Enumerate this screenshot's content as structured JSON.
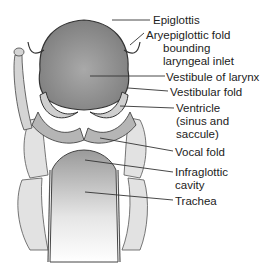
{
  "diagram": {
    "labels": [
      {
        "id": "epiglottis",
        "lines": [
          "Epiglottis"
        ]
      },
      {
        "id": "aryepiglottic",
        "lines": [
          "Aryepiglottic fold",
          "bounding",
          "laryngeal inlet"
        ]
      },
      {
        "id": "vestibule",
        "lines": [
          "Vestibule of larynx"
        ]
      },
      {
        "id": "vestibular-fold",
        "lines": [
          "Vestibular fold"
        ]
      },
      {
        "id": "ventricle",
        "lines": [
          "Ventricle",
          "(sinus and",
          "saccule)"
        ]
      },
      {
        "id": "vocal-fold",
        "lines": [
          "Vocal fold"
        ]
      },
      {
        "id": "infraglottic",
        "lines": [
          "Infraglottic",
          "cavity"
        ]
      },
      {
        "id": "trachea",
        "lines": [
          "Trachea"
        ]
      }
    ]
  },
  "colors": {
    "text": "#222222",
    "leader": "#333333",
    "tissue_dark": "#8a8a8a",
    "tissue_light": "#d8d8d8",
    "background": "#ffffff"
  }
}
